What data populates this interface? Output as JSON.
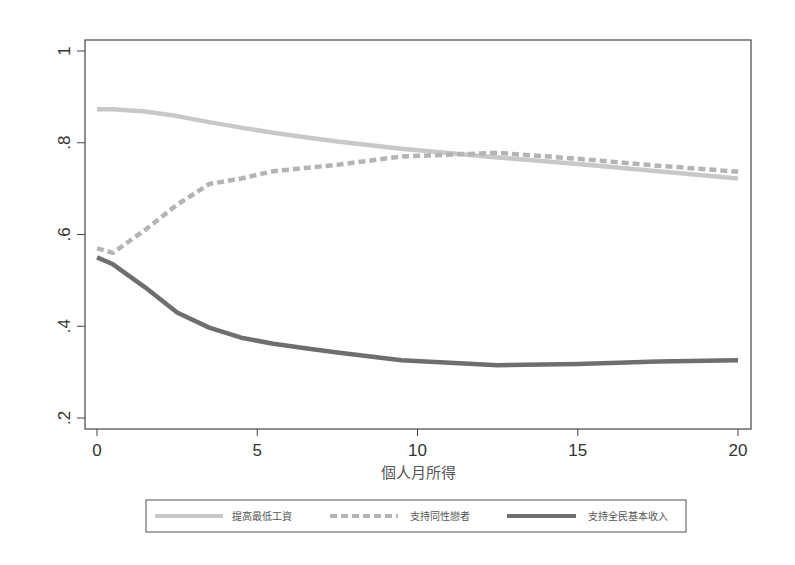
{
  "chart_data": {
    "type": "line",
    "title": "",
    "xlabel": "個人月所得",
    "ylabel": "",
    "xlim": [
      0,
      20
    ],
    "ylim": [
      0.2,
      1.0
    ],
    "x_ticks": [
      0,
      5,
      10,
      15,
      20
    ],
    "x_tick_labels": [
      "0",
      "5",
      "10",
      "15",
      "20"
    ],
    "y_ticks": [
      0.2,
      0.4,
      0.6,
      0.8,
      1.0
    ],
    "y_tick_labels": [
      ".2",
      ".4",
      ".6",
      ".8",
      "1"
    ],
    "grid": false,
    "legend_position": "bottom",
    "series": [
      {
        "name": "提高最低工資",
        "style": "solid-light",
        "color": "#c8c8c8",
        "x": [
          0,
          0.5,
          1.5,
          2.5,
          3.5,
          4.5,
          5.5,
          6.5,
          7.5,
          9.5,
          12.5,
          15,
          17.5,
          20
        ],
        "values": [
          0.873,
          0.873,
          0.868,
          0.858,
          0.845,
          0.833,
          0.822,
          0.812,
          0.803,
          0.787,
          0.768,
          0.754,
          0.738,
          0.722
        ]
      },
      {
        "name": "支持同性戀者",
        "style": "dashed",
        "color": "#b4b4b4",
        "x": [
          0,
          0.5,
          1.5,
          2.5,
          3.5,
          4.5,
          5.5,
          6.5,
          7.5,
          9.5,
          12.5,
          15,
          17.5,
          20
        ],
        "values": [
          0.57,
          0.56,
          0.61,
          0.665,
          0.71,
          0.722,
          0.738,
          0.745,
          0.752,
          0.77,
          0.778,
          0.765,
          0.75,
          0.737
        ]
      },
      {
        "name": "支持全民基本收入",
        "style": "solid-dark",
        "color": "#6e6e6e",
        "x": [
          0,
          0.5,
          1.5,
          2.5,
          3.5,
          4.5,
          5.5,
          6.5,
          7.5,
          9.5,
          12.5,
          15,
          17.5,
          20
        ],
        "values": [
          0.55,
          0.535,
          0.485,
          0.43,
          0.397,
          0.375,
          0.362,
          0.352,
          0.343,
          0.326,
          0.315,
          0.318,
          0.323,
          0.326
        ]
      }
    ]
  },
  "axes": {
    "x_title": "個人月所得"
  },
  "legend": {
    "items": [
      {
        "label": "提高最低工資"
      },
      {
        "label": "支持同性戀者"
      },
      {
        "label": "支持全民基本收入"
      }
    ]
  }
}
